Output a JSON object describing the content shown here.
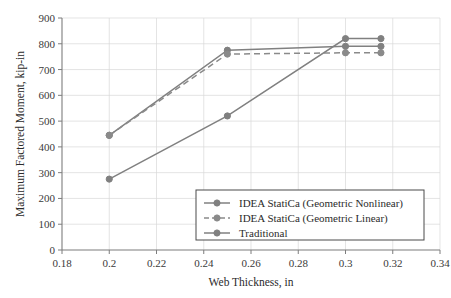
{
  "chart_data": {
    "type": "line",
    "title": "",
    "xlabel": "Web Thickness, in",
    "ylabel": "Maximum Factored Moment, kip-in",
    "xlim": [
      0.18,
      0.34
    ],
    "ylim": [
      0,
      900
    ],
    "xticks": [
      0.18,
      0.2,
      0.22,
      0.24,
      0.26,
      0.28,
      0.3,
      0.32,
      0.34
    ],
    "xtick_labels": [
      "0.18",
      "0.2",
      "0.22",
      "0.24",
      "0.26",
      "0.28",
      "0.3",
      "0.32",
      "0.34"
    ],
    "yticks": [
      0,
      100,
      200,
      300,
      400,
      500,
      600,
      700,
      800,
      900
    ],
    "ytick_labels": [
      "0",
      "100",
      "200",
      "300",
      "400",
      "500",
      "600",
      "700",
      "800",
      "900"
    ],
    "grid": true,
    "grid_color": "#d9d9d9",
    "legend_position": "lower right",
    "series": [
      {
        "name": "IDEA StatiCa (Geometric Nonlinear)",
        "style": "solid",
        "color": "#808080",
        "marker": "circle",
        "x": [
          0.2,
          0.25,
          0.3,
          0.315
        ],
        "values": [
          445,
          775,
          790,
          790
        ]
      },
      {
        "name": "IDEA StatiCa (Geometric Linear)",
        "style": "dashed",
        "color": "#8a8a8a",
        "marker": "circle",
        "x": [
          0.2,
          0.25,
          0.3,
          0.315
        ],
        "values": [
          445,
          760,
          765,
          765
        ]
      },
      {
        "name": "Traditional",
        "style": "solid",
        "color": "#808080",
        "marker": "circle",
        "x": [
          0.2,
          0.25,
          0.3,
          0.315
        ],
        "values": [
          275,
          520,
          820,
          820
        ]
      }
    ]
  }
}
